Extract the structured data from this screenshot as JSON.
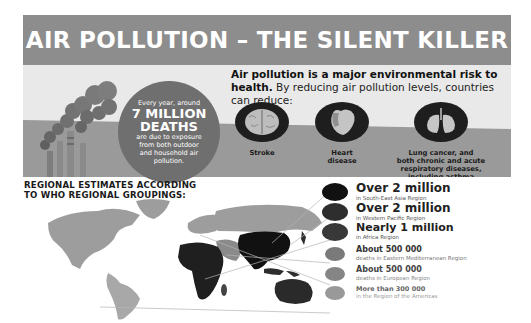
{
  "title": "AIR POLLUTION – THE SILENT KILLER",
  "deaths_callout": {
    "line1": "Every year, around",
    "big1": "7 MILLION",
    "big2": "DEATHS",
    "line2": "are due to exposure",
    "line3": "from both outdoor",
    "line4": "and household air",
    "line5": "pollution."
  },
  "intro": {
    "bold": "Air pollution is a major environmental risk to health.",
    "rest": " By reducing air pollution levels, countries can reduce:"
  },
  "diseases": [
    {
      "icon": "brain-icon",
      "label": "Stroke"
    },
    {
      "icon": "heart-icon",
      "label_line1": "Heart",
      "label_line2": "disease"
    },
    {
      "icon": "lungs-icon",
      "label_line1": "Lung cancer, and",
      "label_line2": "both chronic and acute",
      "label_line3": "respiratory diseases,",
      "label_line4": "including asthma"
    }
  ],
  "regional": {
    "title_line1": "REGIONAL ESTIMATES ACCORDING",
    "title_line2": "TO WHO REGIONAL GROUPINGS:"
  },
  "legend": [
    {
      "value": "Over 2 million",
      "region": "in South-East Asia Region",
      "color": "#111111"
    },
    {
      "value": "Over 2 million",
      "region": "in Western Pacific Region",
      "color": "#2e2e2e"
    },
    {
      "value": "Nearly 1 million",
      "region": "in Africa Region",
      "color": "#383838"
    },
    {
      "value": "About 500 000",
      "region": "deaths in Eastern Mediterranean Region",
      "color": "#7a7a7a"
    },
    {
      "value": "About 500 000",
      "region": "deaths in European Region",
      "color": "#858585"
    },
    {
      "value": "More than 300 000",
      "region": "in the Region of the Americas",
      "color": "#999999"
    }
  ],
  "colors": {
    "banner": "#8d8d8d",
    "panel": "#e9e9e9",
    "band": "#9a9a9a",
    "map_light": "#9d9d9d",
    "map_dark": "#1f1f1f"
  }
}
